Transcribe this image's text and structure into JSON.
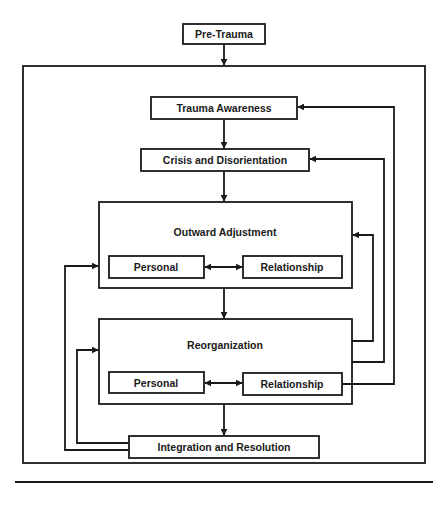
{
  "diagram": {
    "type": "flowchart",
    "colors": {
      "stroke": "#1a1a1a",
      "background": "#ffffff",
      "text": "#1a1a1a"
    },
    "nodes": {
      "pre_trauma": "Pre-Trauma",
      "trauma_awareness": "Trauma Awareness",
      "crisis": "Crisis and Disorientation",
      "outward_adjustment": "Outward Adjustment",
      "outward_personal": "Personal",
      "outward_relationship": "Relationship",
      "reorganization": "Reorganization",
      "reorg_personal": "Personal",
      "reorg_relationship": "Relationship",
      "integration": "Integration and Resolution"
    },
    "edges": [
      {
        "from": "Pre-Trauma",
        "to": "Trauma Awareness"
      },
      {
        "from": "Trauma Awareness",
        "to": "Crisis and Disorientation"
      },
      {
        "from": "Crisis and Disorientation",
        "to": "Outward Adjustment"
      },
      {
        "from": "Outward Adjustment",
        "to": "Reorganization"
      },
      {
        "from": "Reorganization",
        "to": "Integration and Resolution"
      },
      {
        "from": "Personal",
        "to": "Relationship",
        "bidirectional": true,
        "within": "Outward Adjustment"
      },
      {
        "from": "Personal",
        "to": "Relationship",
        "bidirectional": true,
        "within": "Reorganization"
      },
      {
        "from": "Reorganization",
        "to": "Outward Adjustment",
        "feedback": true
      },
      {
        "from": "Reorganization",
        "to": "Crisis and Disorientation",
        "feedback": true
      },
      {
        "from": "Reorganization",
        "to": "Trauma Awareness",
        "feedback": true
      },
      {
        "from": "Integration and Resolution",
        "to": "Outward Adjustment",
        "feedback": true
      },
      {
        "from": "Integration and Resolution",
        "to": "Reorganization",
        "feedback": true
      }
    ]
  }
}
